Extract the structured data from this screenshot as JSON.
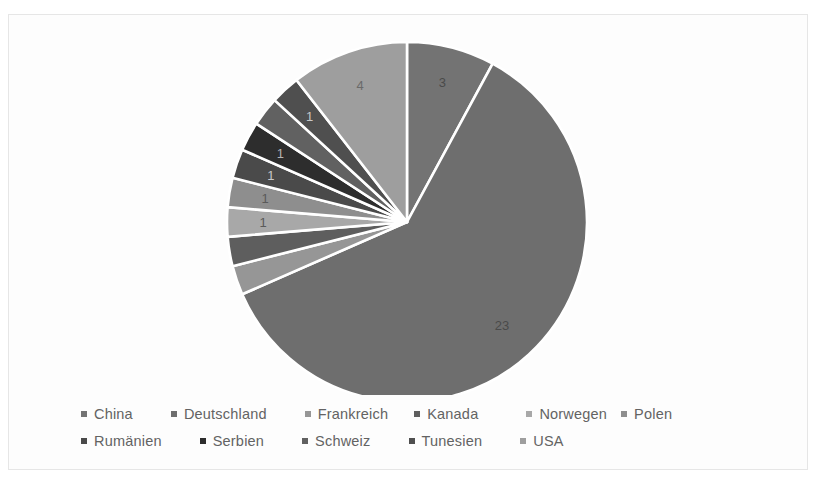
{
  "scan": {
    "top_ghost_text": "",
    "top_ghost_mark": ""
  },
  "chart_data": {
    "type": "pie",
    "title": "",
    "subtitle": "",
    "xlabel": "",
    "ylabel": "",
    "grid": false,
    "legend_position": "bottom",
    "start_angle_deg": 0,
    "direction": "clockwise",
    "categories": [
      "China",
      "Deutschland",
      "Frankreich",
      "Kanada",
      "Norwegen",
      "Polen",
      "Rumänien",
      "Serbien",
      "Schweiz",
      "Tunesien",
      "USA"
    ],
    "values": [
      3,
      23,
      1,
      1,
      1,
      1,
      1,
      1,
      1,
      1,
      4
    ],
    "data_labels": [
      "3",
      "23",
      "1",
      "1",
      "1",
      "1",
      "1",
      "1",
      "1",
      "1",
      "4"
    ],
    "data_labels_visible": [
      true,
      true,
      false,
      false,
      true,
      true,
      true,
      true,
      false,
      true,
      true
    ],
    "colors": [
      "#737373",
      "#6e6e6e",
      "#969696",
      "#5e5e5e",
      "#a8a8a8",
      "#8e8e8e",
      "#4a4a4a",
      "#2d2d2d",
      "#616161",
      "#4f4f4f",
      "#9e9e9e"
    ],
    "total": 38,
    "slice_label_colors": [
      "#4a4a4a",
      "#4a4a4a",
      "#ffffff",
      "#ffffff",
      "#5a5a5a",
      "#5a5a5a",
      "#c8c8c8",
      "#b4b4b4",
      "#ffffff",
      "#c8c8c8",
      "#6a6a6a"
    ]
  },
  "legend": {
    "rows": [
      [
        {
          "label": "China",
          "color": "#737373"
        },
        {
          "label": "Deutschland",
          "color": "#6e6e6e"
        },
        {
          "label": "Frankreich",
          "color": "#969696"
        },
        {
          "label": "Kanada",
          "color": "#5e5e5e"
        },
        {
          "label": "Norwegen",
          "color": "#a8a8a8"
        },
        {
          "label": "Polen",
          "color": "#8e8e8e"
        }
      ],
      [
        {
          "label": "Rumänien",
          "color": "#4a4a4a"
        },
        {
          "label": "Serbien",
          "color": "#2d2d2d"
        },
        {
          "label": "Schweiz",
          "color": "#616161"
        },
        {
          "label": "Tunesien",
          "color": "#4f4f4f"
        },
        {
          "label": "USA",
          "color": "#9e9e9e"
        }
      ]
    ]
  },
  "style": {
    "frame_border_color": "#e6e6e6",
    "plot_background": "#fdfdfd",
    "slice_separator_color": "#ffffff",
    "legend_text_color": "#636363"
  }
}
